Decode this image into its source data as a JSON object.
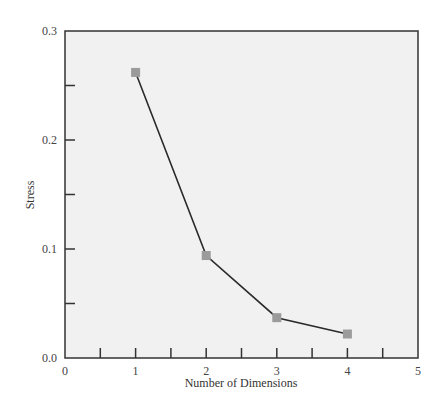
{
  "chart_data": {
    "type": "line",
    "title": "",
    "xlabel": "Number of Dimensions",
    "ylabel": "Stress",
    "x": [
      1,
      2,
      3,
      4
    ],
    "series": [
      {
        "name": "Stress",
        "values": [
          0.262,
          0.094,
          0.037,
          0.022
        ]
      }
    ],
    "xlim": [
      0,
      5
    ],
    "ylim": [
      0.0,
      0.3
    ],
    "x_ticks": [
      "0",
      "1",
      "2",
      "3",
      "4",
      "5"
    ],
    "y_ticks": [
      "0.0",
      "0.1",
      "0.2",
      "0.3"
    ],
    "grid": false,
    "legend": "none",
    "colors": {
      "background": "#f1f1f1",
      "line": "#2a2a2a",
      "marker": "#9b9b9b",
      "axis": "#333333"
    }
  }
}
